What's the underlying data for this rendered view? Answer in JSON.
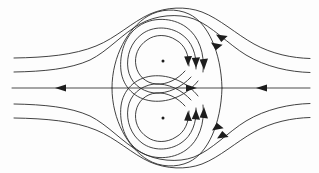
{
  "figure": {
    "type": "streamline-diagram",
    "width": 319,
    "height": 173,
    "background_color": "#fdfdfd",
    "line_color": "#2c2c2c",
    "arrow_color": "#1d1d1d",
    "caption": ""
  },
  "chart_data": {
    "type": "line",
    "subtitle": "",
    "xlabel": "",
    "ylabel": "",
    "xlim": [
      0,
      319
    ],
    "ylim": [
      0,
      173
    ],
    "grid": false,
    "legend": false,
    "annotations": [],
    "axis_of_symmetry_y": 88,
    "vortex_centers": [
      {
        "name": "upper-vortex-center",
        "x": 163,
        "y": 61,
        "rotation": "clockwise"
      },
      {
        "name": "lower-vortex-center",
        "x": 163,
        "y": 118,
        "rotation": "counter-clockwise"
      }
    ],
    "separatrix": {
      "name": "outer-separatrix",
      "left_cusp": {
        "x": 112,
        "y": 88
      },
      "right_cusp": {
        "x": 222,
        "y": 88
      },
      "top": {
        "x": 166,
        "y": 9
      },
      "bottom": {
        "x": 166,
        "y": 167
      }
    },
    "series": [
      {
        "name": "outer-streamline-upper-1",
        "direction": "right-to-left"
      },
      {
        "name": "outer-streamline-upper-2",
        "direction": "right-to-left"
      },
      {
        "name": "outer-streamline-lower-1",
        "direction": "right-to-left"
      },
      {
        "name": "outer-streamline-lower-2",
        "direction": "right-to-left"
      },
      {
        "name": "axis-streamline",
        "direction": "bidirectional"
      },
      {
        "name": "upper-vortex-loop-outer",
        "direction": "clockwise"
      },
      {
        "name": "upper-vortex-loop-middle",
        "direction": "clockwise"
      },
      {
        "name": "upper-vortex-loop-inner",
        "direction": "clockwise"
      },
      {
        "name": "lower-vortex-loop-outer",
        "direction": "counter-clockwise"
      },
      {
        "name": "lower-vortex-loop-middle",
        "direction": "counter-clockwise"
      },
      {
        "name": "lower-vortex-loop-inner",
        "direction": "counter-clockwise"
      }
    ],
    "arrow_count": 13
  }
}
